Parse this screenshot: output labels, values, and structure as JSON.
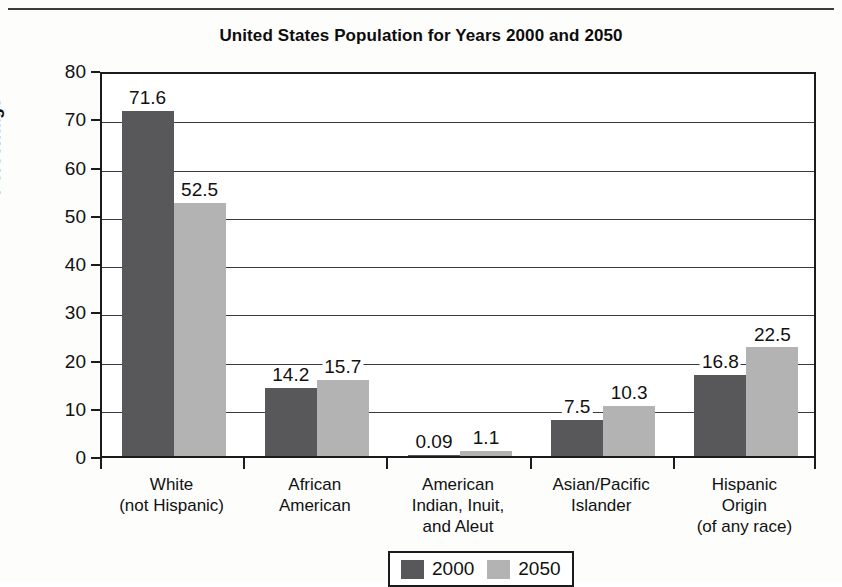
{
  "chart_data": {
    "type": "bar",
    "title": "United States Population for Years 2000 and 2050",
    "xlabel": "",
    "ylabel": "Percentage",
    "ylim": [
      0,
      80
    ],
    "yticks": [
      0,
      10,
      20,
      30,
      40,
      50,
      60,
      70,
      80
    ],
    "grid": true,
    "legend_position": "bottom",
    "categories": [
      "White\n(not Hispanic)",
      "African\nAmerican",
      "American\nIndian, Inuit,\nand Aleut",
      "Asian/Pacific\nIslander",
      "Hispanic\nOrigin\n(of any race)"
    ],
    "category_lines": [
      [
        "White",
        "(not Hispanic)"
      ],
      [
        "African",
        "American"
      ],
      [
        "American",
        "Indian, Inuit,",
        "and Aleut"
      ],
      [
        "Asian/Pacific",
        "Islander"
      ],
      [
        "Hispanic",
        "Origin",
        "(of any race)"
      ]
    ],
    "series": [
      {
        "name": "2000",
        "color": "#58585a",
        "values": [
          71.6,
          14.2,
          0.09,
          7.5,
          16.8
        ],
        "labels": [
          "71.6",
          "14.2",
          "0.09",
          "7.5",
          "16.8"
        ]
      },
      {
        "name": "2050",
        "color": "#b3b3b3",
        "values": [
          52.5,
          15.7,
          1.1,
          10.3,
          22.5
        ],
        "labels": [
          "52.5",
          "15.7",
          "1.1",
          "10.3",
          "22.5"
        ]
      }
    ]
  },
  "legend": {
    "entries": [
      {
        "label": "2000",
        "color": "#58585a"
      },
      {
        "label": "2050",
        "color": "#b3b3b3"
      }
    ]
  },
  "axis": {
    "y_title": "Percentage",
    "y_tick_labels": [
      "80",
      "70",
      "60",
      "50",
      "40",
      "30",
      "20",
      "10",
      "0"
    ]
  },
  "colors": {
    "series_2000": "#58585a",
    "series_2050": "#b3b3b3",
    "axis": "#1b1b1b",
    "grid": "#3a3a3a",
    "text": "#111111",
    "background": "#fdfdfc"
  }
}
